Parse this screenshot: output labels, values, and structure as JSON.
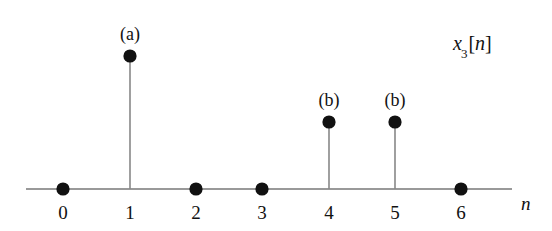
{
  "figure": {
    "background_color": "#ffffff",
    "ink_color": "#111111",
    "axis_color": "#666666",
    "signal_label": {
      "base": "x",
      "subscript": "3",
      "bracket_open": "[",
      "index": "n",
      "bracket_close": "]",
      "full": "x3[n]",
      "x": 453,
      "y": 45
    },
    "axis_variable_label": {
      "text": "n",
      "x": 521,
      "y": 203
    },
    "axis": {
      "x_start": 26,
      "x_end": 512,
      "y": 189
    }
  },
  "chart_data": {
    "type": "scatter",
    "title": "",
    "subtitle": "",
    "xlabel": "n",
    "ylabel": "",
    "series_name": "x3[n]",
    "grid": false,
    "legend": "none",
    "xlim": [
      -0.55,
      6.85
    ],
    "ylim": [
      0,
      2.3
    ],
    "categories": [
      "0",
      "1",
      "2",
      "3",
      "4",
      "5",
      "6"
    ],
    "x": [
      0,
      1,
      2,
      3,
      4,
      5,
      6
    ],
    "values": [
      0,
      2,
      0,
      0,
      1,
      1,
      0
    ],
    "tick_labels": [
      "0",
      "1",
      "2",
      "3",
      "4",
      "5",
      "6"
    ],
    "annotations": [
      {
        "label": "(a)",
        "x": 1
      },
      {
        "label": "(b)",
        "x": 4
      },
      {
        "label": "(b)",
        "x": 5
      }
    ],
    "points": [
      {
        "n": 0,
        "value": 0,
        "label": "",
        "px": 63,
        "py": 189,
        "stem": false
      },
      {
        "n": 1,
        "value": 2,
        "label": "(a)",
        "px": 130,
        "py": 56,
        "stem": true
      },
      {
        "n": 2,
        "value": 0,
        "label": "",
        "px": 196,
        "py": 189,
        "stem": false
      },
      {
        "n": 3,
        "value": 0,
        "label": "",
        "px": 262,
        "py": 189,
        "stem": false
      },
      {
        "n": 4,
        "value": 1,
        "label": "(b)",
        "px": 329,
        "py": 122,
        "stem": true
      },
      {
        "n": 5,
        "value": 1,
        "label": "(b)",
        "px": 395,
        "py": 122,
        "stem": true
      },
      {
        "n": 6,
        "value": 0,
        "label": "",
        "px": 461,
        "py": 189,
        "stem": false
      }
    ]
  }
}
